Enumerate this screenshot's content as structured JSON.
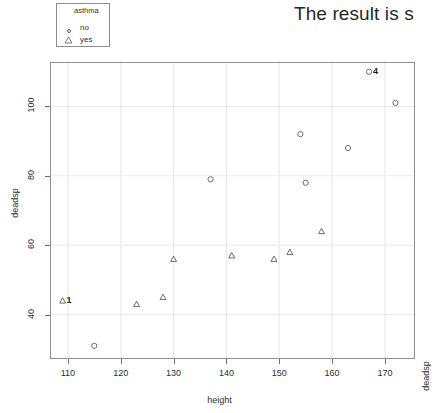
{
  "overlay_text": "The result is s",
  "legend": {
    "title": "asthma",
    "entries": [
      {
        "label": "no",
        "marker": "circle-icon"
      },
      {
        "label": "yes",
        "marker": "triangle-icon"
      }
    ]
  },
  "axes": {
    "x_title": "height",
    "y_title": "deadsp",
    "y_title_right": "deadsp",
    "x_ticks": [
      "110",
      "120",
      "130",
      "140",
      "150",
      "160",
      "170"
    ],
    "y_ticks": [
      "100",
      "80",
      "60",
      "40"
    ]
  },
  "chart_data": {
    "type": "scatter",
    "title": "",
    "xlabel": "height",
    "ylabel": "deadsp",
    "xlim": [
      106.8,
      175.5
    ],
    "ylim": [
      27.5,
      112.5
    ],
    "x_ticks": [
      110,
      120,
      130,
      140,
      150,
      160,
      170
    ],
    "y_ticks": [
      40,
      60,
      80,
      100
    ],
    "grid": true,
    "legend": {
      "title": "asthma",
      "position": "top-left"
    },
    "series": [
      {
        "name": "no",
        "marker": "circle",
        "points": [
          {
            "x": 115,
            "y": 31
          },
          {
            "x": 137,
            "y": 79
          },
          {
            "x": 154,
            "y": 92
          },
          {
            "x": 155,
            "y": 78
          },
          {
            "x": 163,
            "y": 88
          },
          {
            "x": 172,
            "y": 101
          },
          {
            "x": 167,
            "y": 110,
            "label": "4"
          }
        ]
      },
      {
        "name": "yes",
        "marker": "triangle",
        "points": [
          {
            "x": 109,
            "y": 44,
            "label": "1"
          },
          {
            "x": 123,
            "y": 43
          },
          {
            "x": 128,
            "y": 45
          },
          {
            "x": 130,
            "y": 56
          },
          {
            "x": 141,
            "y": 57
          },
          {
            "x": 149,
            "y": 56
          },
          {
            "x": 152,
            "y": 58
          },
          {
            "x": 158,
            "y": 64
          }
        ]
      }
    ],
    "annotations": [
      {
        "text": "1",
        "x": 109,
        "y": 44
      },
      {
        "text": "4",
        "x": 167,
        "y": 110
      }
    ]
  }
}
